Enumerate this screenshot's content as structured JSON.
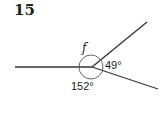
{
  "question_number": "15",
  "diagram": {
    "unknown_angle_label": "f",
    "angle_right": "49°",
    "angle_bottom": "152°"
  }
}
